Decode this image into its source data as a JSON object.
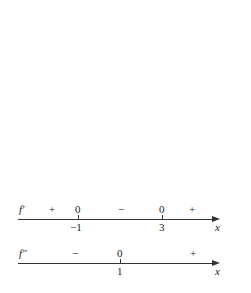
{
  "sign_charts": [
    {
      "function_label": "f′",
      "axis_label": "x",
      "critical_points": [
        "−1",
        "3"
      ],
      "zeros_label": "0",
      "signs": [
        "+",
        "−",
        "+"
      ]
    },
    {
      "function_label": "f″",
      "axis_label": "x",
      "critical_points": [
        "1"
      ],
      "zeros_label": "0",
      "signs": [
        "−",
        "+"
      ]
    }
  ]
}
